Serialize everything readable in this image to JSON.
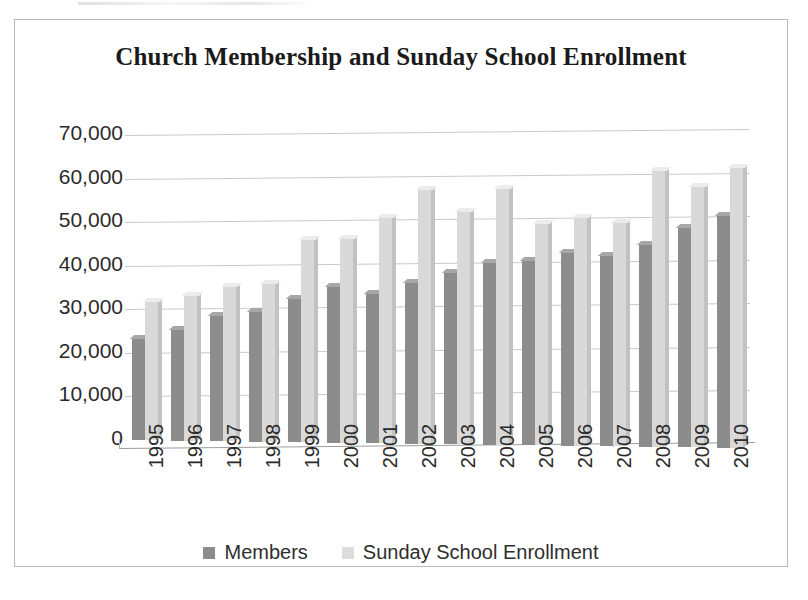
{
  "chart_data": {
    "type": "bar",
    "title": "Church Membership and Sunday School Enrollment",
    "xlabel": "",
    "ylabel": "",
    "ylim": [
      0,
      70000
    ],
    "ytick_step": 10000,
    "grid": true,
    "legend_position": "bottom",
    "categories": [
      "1995",
      "1996",
      "1997",
      "1998",
      "1999",
      "2000",
      "2001",
      "2002",
      "2003",
      "2004",
      "2005",
      "2006",
      "2007",
      "2008",
      "2009",
      "2010"
    ],
    "ytick_labels": [
      "70,000",
      "60,000",
      "50,000",
      "40,000",
      "30,000",
      "20,000",
      "10,000",
      "0"
    ],
    "ytick_values": [
      70000,
      60000,
      50000,
      40000,
      30000,
      20000,
      10000,
      0
    ],
    "series": [
      {
        "name": "Members",
        "color": "#8c8c8c",
        "values": [
          23500,
          25500,
          29000,
          30000,
          33000,
          36000,
          34500,
          37000,
          39500,
          42000,
          42500,
          44500,
          44000,
          46500,
          50500,
          53500
        ]
      },
      {
        "name": "Sunday School Enrollment",
        "color": "#d9d9d9",
        "values": [
          32000,
          33500,
          35500,
          36500,
          46500,
          47000,
          52000,
          58500,
          53500,
          59000,
          51000,
          52500,
          51500,
          63500,
          60000,
          64500
        ]
      }
    ]
  },
  "legend": {
    "items": [
      {
        "label": "Members",
        "swatch": "members"
      },
      {
        "label": "Sunday School Enrollment",
        "swatch": "sunday"
      }
    ]
  }
}
